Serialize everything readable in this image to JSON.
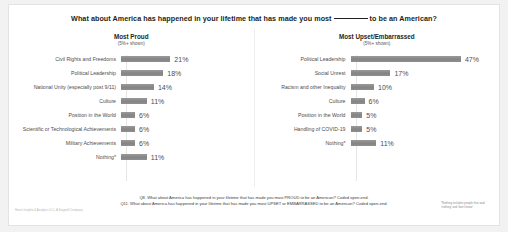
{
  "slide": {
    "title_before": "What about America has happened in your lifetime that has made you most",
    "title_after": "to be an American?"
  },
  "chart_data": {
    "type": "bar",
    "xlabel": "",
    "ylabel": "",
    "xlim": [
      0,
      50
    ],
    "grid": false,
    "legend": "none",
    "panels": [
      {
        "name": "most-proud",
        "heading": "Most Proud",
        "subheading": "(5%+ shown)",
        "categories": [
          "Civil Rights and Freedoms",
          "Political Leadership",
          "National Unity (especially post 9/11)",
          "Culture",
          "Position in the World",
          "Scientific or Technological Achievements",
          "Military Achievements",
          "Nothing*"
        ],
        "values": [
          21,
          18,
          14,
          11,
          6,
          6,
          6,
          11
        ],
        "labels": [
          "21%",
          "18%",
          "14%",
          "11%",
          "6%",
          "6%",
          "6%",
          "11%"
        ]
      },
      {
        "name": "most-upset-embarrassed",
        "heading": "Most Upset/Embarrassed",
        "subheading": "(5%+ shown)",
        "categories": [
          "Political Leadership",
          "Social Unrest",
          "Racism and other Inequality",
          "Culture",
          "Position in the World",
          "Handling of COVID-19",
          "Nothing*"
        ],
        "values": [
          47,
          17,
          10,
          6,
          5,
          5,
          11
        ],
        "labels": [
          "47%",
          "17%",
          "10%",
          "6%",
          "5%",
          "5%",
          "11%"
        ]
      }
    ]
  },
  "footnotes": {
    "q8": "Q8. What about America has happened in your lifetime that has made you most PROUD to be an American? Coded open-end.",
    "q11": "Q11. What about America has happened in your lifetime that has made you most UPSET or EMBARRASSED to be an American? Coded open-end."
  },
  "asterisk_note": "*Nothing includes people that said 'nothing' and 'don't know'",
  "source": "Harris Insights & Analytics LLC, A Stagwell Company",
  "colors": {
    "bar": "#8c8c8c",
    "text": "#4d4d4f",
    "background": "#ffffff"
  }
}
